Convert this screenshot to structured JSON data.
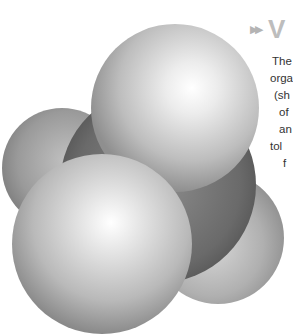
{
  "figure": {
    "atoms": [
      {
        "role": "carbon",
        "position": "center",
        "color": "#6e6e6e"
      },
      {
        "role": "hydrogen",
        "position": "top",
        "color": "#cfcfcf"
      },
      {
        "role": "hydrogen",
        "position": "front-left",
        "color": "#d4d4d4"
      },
      {
        "role": "hydrogen",
        "position": "back-left",
        "color": "#a9a9a9"
      },
      {
        "role": "hydrogen",
        "position": "back-right",
        "color": "#b5b5b5"
      }
    ]
  },
  "sidebar": {
    "heading_icon": "double-arrow-icon",
    "heading_arrows": "▶▶",
    "heading_title": "V",
    "lines": [
      "The",
      "orga",
      "(sh",
      "of",
      "an",
      "tol",
      "f"
    ],
    "heading_color": "#bdbdbd",
    "text_color": "#333333"
  }
}
